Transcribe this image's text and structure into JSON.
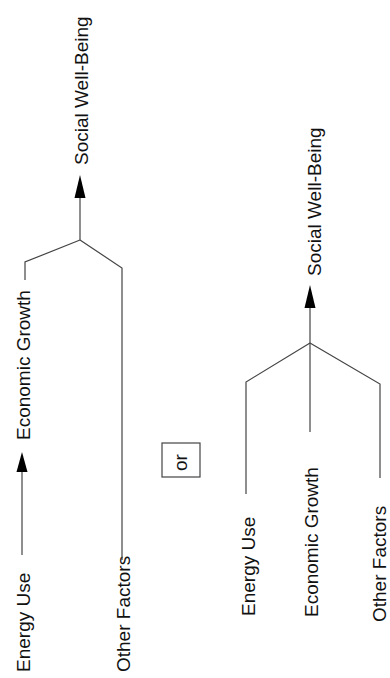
{
  "diagram": {
    "left_model": {
      "energy_use": "Energy Use",
      "economic_growth": "Economic Growth",
      "other_factors": "Other Factors",
      "social_well_being": "Social Well-Being"
    },
    "separator": "or",
    "right_model": {
      "energy_use": "Energy Use",
      "economic_growth": "Economic Growth",
      "other_factors": "Other Factors",
      "social_well_being": "Social Well-Being"
    },
    "colors": {
      "line": "#444444",
      "arrowhead": "#000000",
      "text": "#111111",
      "background": "#ffffff"
    }
  }
}
